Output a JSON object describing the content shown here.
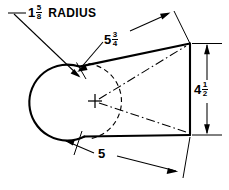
{
  "drawing": {
    "title": "Rounded-end plate detail drawing",
    "background_color": "#ffffff",
    "line_color": "#000000",
    "dimensions": [
      {
        "id": "radius",
        "name": "corner-radius",
        "whole": "1",
        "numerator": "5",
        "denominator": "8",
        "suffix": "RADIUS",
        "full_text": "1 5/8 RADIUS",
        "kind": "leader"
      },
      {
        "id": "slant",
        "name": "slant-length",
        "whole": "5",
        "numerator": "3",
        "denominator": "4",
        "suffix": "",
        "full_text": "5 3/4",
        "kind": "aligned"
      },
      {
        "id": "height",
        "name": "right-edge-height",
        "whole": "4",
        "numerator": "1",
        "denominator": "2",
        "suffix": "",
        "full_text": "4 1/2",
        "kind": "vertical"
      },
      {
        "id": "width",
        "name": "overall-width",
        "whole": "5",
        "numerator": "",
        "denominator": "",
        "suffix": "",
        "full_text": "5",
        "kind": "horizontal"
      }
    ]
  }
}
